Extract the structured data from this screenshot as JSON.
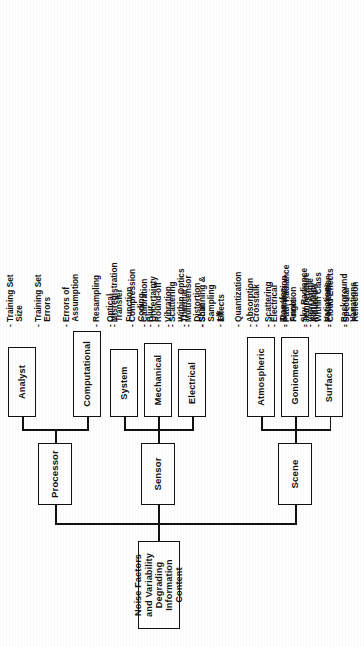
{
  "figure": {
    "title": "Noise Factors and Variability Degrading Information Content",
    "orientation": "rotated-90-ccw",
    "type": "hierarchy-tree"
  },
  "root": {
    "label": "Noise Factors and\nVariability Degrading\nInformation Content"
  },
  "branches": [
    {
      "id": "scene",
      "label": "Scene",
      "children": [
        {
          "id": "surface",
          "label": "Surface",
          "items": [
            "- Within Class\n  Variations",
            "- Background\n  Variations",
            "- Mixed\n  Pixels",
            "- Adjacent\n  Reflections",
            "- Surface Slope\n  & Aspect",
            "- Obscuring\n  Objects"
          ]
        },
        {
          "id": "goniometric",
          "label": "Goniometric",
          "items": [
            "- Illumination\n  Angle",
            "- View Angle",
            "- Polarization",
            "- Specular\n  Reflection"
          ]
        },
        {
          "id": "atmospheric",
          "label": "Atmospheric",
          "items": [
            "- Absorption",
            "- Scattering",
            "- Path Radiance",
            "- Sky Radiance\n  Variability",
            "- Cloud Effects"
          ]
        }
      ]
    },
    {
      "id": "sensor",
      "label": "Sensor",
      "children": [
        {
          "id": "electrical",
          "label": "Electrical",
          "items": [
            "- Thermal",
            "- Shot",
            "- 1/f",
            "- Quantization",
            "- Crosstalk",
            "- Electrical\n  Transfer\n  Function",
            "- Temperature\n  Induced"
          ]
        },
        {
          "id": "mechanical",
          "label": "Mechanical",
          "items": [
            "- Blur",
            "- Vibration",
            "- Multisensor\n  Distortion"
          ]
        },
        {
          "id": "system",
          "label": "System",
          "items": [
            "- Optical\n  Transfer\n  Function",
            "- Calibration\n  Uncertainty",
            "- Scattering\n  Within Optics",
            "- Scanning &\n  Sampling\n  Effects"
          ]
        }
      ]
    },
    {
      "id": "processor",
      "label": "Processor",
      "children": [
        {
          "id": "computational",
          "label": "Computational",
          "items": [
            "- Resampling",
            "- Misregistration",
            "- Compression\n  Coding",
            "- Round-off"
          ]
        },
        {
          "id": "analyst",
          "label": "Analyst",
          "items": [
            "- Training Set\n  Size",
            "- Training Set\n  Errors",
            "- Errors of\n  Assumption"
          ]
        }
      ]
    }
  ],
  "colors": {
    "ink": "#111111",
    "paper": "#ffffff"
  }
}
